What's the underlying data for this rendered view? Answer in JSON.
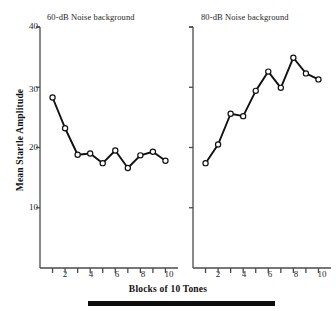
{
  "figure": {
    "axis_color": "#4a4a4a",
    "line_color": "#111111",
    "marker_fill": "#ffffff",
    "marker_stroke": "#111111",
    "footer_bar_color": "#0d0d0d"
  },
  "axes": {
    "ylabel": "Mean Startle Amplitude",
    "xlabel": "Blocks of 10 Tones",
    "y_ticks": [
      10,
      20,
      30,
      40
    ],
    "y_tick_labels": [
      "10",
      "20",
      "30",
      "40"
    ],
    "x_ticks": [
      1,
      2,
      3,
      4,
      5,
      6,
      7,
      8,
      9,
      10
    ],
    "x_tick_labels": [
      "",
      "2",
      "",
      "4",
      "",
      "6",
      "",
      "8",
      "",
      "10"
    ],
    "ylim": [
      0,
      40
    ],
    "xlim": [
      0.5,
      10.5
    ]
  },
  "chart_data": [
    {
      "type": "line",
      "title": "60-dB Noise background",
      "xlabel": "Blocks of 10 Tones",
      "ylabel": "Mean Startle Amplitude",
      "x": [
        1,
        2,
        3,
        4,
        5,
        6,
        7,
        8,
        9,
        10
      ],
      "categories": [
        "1",
        "2",
        "3",
        "4",
        "5",
        "6",
        "7",
        "8",
        "9",
        "10"
      ],
      "values": [
        28.3,
        23.2,
        18.8,
        19.0,
        17.4,
        19.5,
        16.6,
        18.7,
        19.3,
        17.8
      ],
      "ylim": [
        0,
        40
      ],
      "xlim": [
        0.5,
        10.5
      ],
      "grid": false,
      "legend": "none",
      "marker": "open-circle"
    },
    {
      "type": "line",
      "title": "80-dB Noise background",
      "xlabel": "Blocks of 10 Tones",
      "ylabel": "Mean Startle Amplitude",
      "x": [
        1,
        2,
        3,
        4,
        5,
        6,
        7,
        8,
        9,
        10
      ],
      "categories": [
        "1",
        "2",
        "3",
        "4",
        "5",
        "6",
        "7",
        "8",
        "9",
        "10"
      ],
      "values": [
        17.4,
        20.5,
        25.6,
        25.2,
        29.4,
        32.6,
        29.9,
        34.9,
        32.3,
        31.3
      ],
      "ylim": [
        0,
        40
      ],
      "xlim": [
        0.5,
        10.5
      ],
      "grid": false,
      "legend": "none",
      "marker": "open-circle"
    }
  ],
  "left_panel": {
    "title": "60-dB Noise background",
    "y_tick_labels": [
      "10",
      "20",
      "30",
      "40"
    ]
  },
  "right_panel": {
    "title": "80-dB Noise background"
  },
  "x_tick_labels_left": [
    "2",
    "4",
    "6",
    "8",
    "10"
  ],
  "x_tick_labels_right": [
    "2",
    "4",
    "6",
    "8",
    "10"
  ]
}
